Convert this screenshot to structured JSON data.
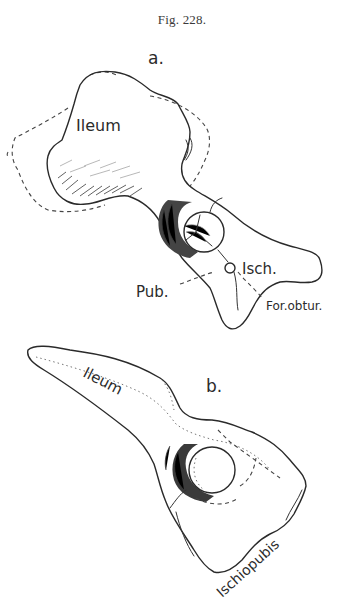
{
  "figure": {
    "caption": "Fig. 228.",
    "panels": [
      {
        "id": "a",
        "label": "a.",
        "annotations": [
          "Ileum",
          "Isch.",
          "Pub.",
          "For. obtur."
        ]
      },
      {
        "id": "b",
        "label": "b.",
        "annotations": [
          "Ileum",
          "Ischiopubis"
        ]
      }
    ]
  },
  "labels": {
    "caption": "Fig. 228.",
    "panel_a": "a.",
    "panel_a_ileum": "Ileum",
    "panel_a_isch": "Isch.",
    "panel_a_pub": "Pub.",
    "panel_a_for_obtur": "For.obtur.",
    "panel_b": "b.",
    "panel_b_ileum": "Ileum",
    "panel_b_ischiopubis": "Ischiopubis"
  },
  "colors": {
    "ink": "#2a2a2a",
    "paper": "#ffffff"
  }
}
